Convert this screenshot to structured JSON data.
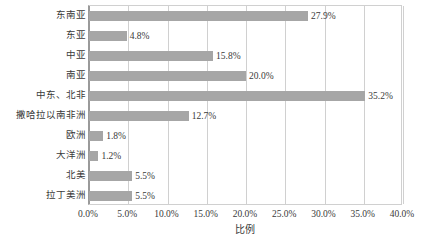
{
  "chart_data": {
    "type": "bar",
    "orientation": "horizontal",
    "title": "",
    "xlabel": "比例",
    "ylabel": "",
    "categories": [
      "东南亚",
      "东亚",
      "中亚",
      "南亚",
      "中东、北非",
      "撒哈拉以南非洲",
      "欧洲",
      "大洋洲",
      "北美",
      "拉丁美洲"
    ],
    "values": [
      27.9,
      4.8,
      15.8,
      20.0,
      35.2,
      12.7,
      1.8,
      1.2,
      5.5,
      5.5
    ],
    "value_labels": [
      "27.9%",
      "4.8%",
      "15.8%",
      "20.0%",
      "35.2%",
      "12.7%",
      "1.8%",
      "1.2%",
      "5.5%",
      "5.5%"
    ],
    "xlim": [
      0,
      40
    ],
    "xticks": [
      0,
      5,
      10,
      15,
      20,
      25,
      30,
      35,
      40
    ],
    "xtick_labels": [
      "0.0%",
      "5.0%",
      "10.0%",
      "15.0%",
      "20.0%",
      "25.0%",
      "30.0%",
      "35.0%",
      "40.0%"
    ],
    "grid": true,
    "gridlines": "vertical",
    "legend": false,
    "series_color": "#a6a6a6",
    "gridline_color": "#d0d0d0",
    "axis_color": "#9a9a9a",
    "text_color": "#3a3a3a",
    "background": "#ffffff"
  }
}
